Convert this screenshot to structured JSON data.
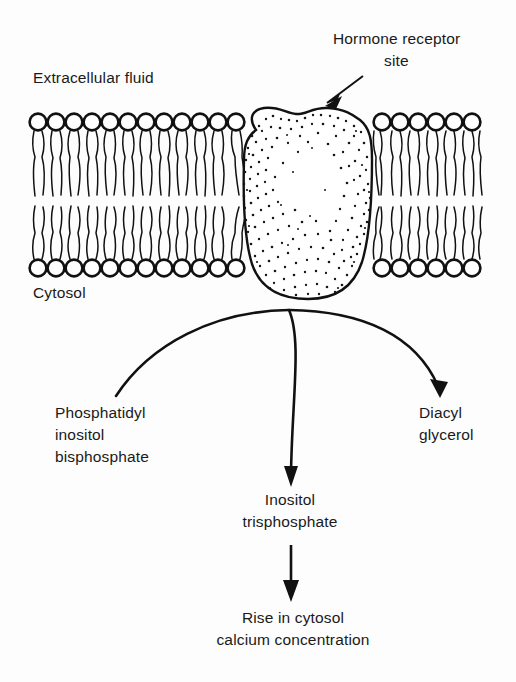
{
  "figure": {
    "width": 516,
    "height": 682,
    "background_color": "#fdfdfd",
    "ink_color": "#111111"
  },
  "labels": {
    "extracellular_fluid": "Extracellular fluid",
    "cytosol": "Cytosol",
    "hormone_receptor_line1": "Hormone receptor",
    "hormone_receptor_line2": "site"
  },
  "pathway": {
    "substrate": {
      "line1": "Phosphatidyl",
      "line2": "inositol",
      "line3": "bisphosphate"
    },
    "product_right": {
      "line1": "Diacyl",
      "line2": "glycerol"
    },
    "product_center": {
      "line1": "Inositol",
      "line2": "trisphosphate"
    },
    "outcome": {
      "line1": "Rise in cytosol",
      "line2": "calcium concentration"
    }
  },
  "membrane": {
    "upper_heads_left_count": 12,
    "upper_heads_right_count": 6,
    "lower_heads_left_count": 12,
    "lower_heads_right_count": 6,
    "head_diameter_px": 17,
    "head_spacing_px": 18,
    "upper_head_center_y": 122,
    "lower_head_center_y": 268
  },
  "receptor": {
    "shape": "stippled-oval-transmembrane",
    "left_edge_x": 245,
    "right_edge_x": 371,
    "top_y": 108,
    "bottom_y": 299
  }
}
